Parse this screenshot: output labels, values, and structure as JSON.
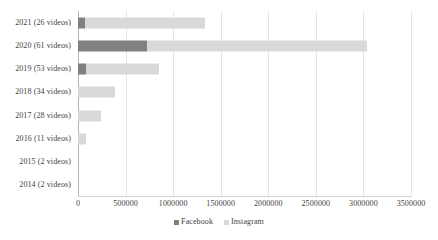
{
  "chart_data": {
    "type": "bar",
    "orientation": "horizontal",
    "stacked": true,
    "title": "",
    "xlabel": "",
    "ylabel": "",
    "grid": true,
    "legend_position": "bottom",
    "xlim": [
      0,
      3500000
    ],
    "xticks": [
      0,
      500000,
      1000000,
      1500000,
      2000000,
      2500000,
      3000000,
      3500000
    ],
    "xtick_labels": [
      "0",
      "500000",
      "1000000",
      "1500000",
      "2000000",
      "2500000",
      "3000000",
      "3500000"
    ],
    "categories": [
      "2021 (26 videos)",
      "2020 (61 videos)",
      "2019 (53 videos)",
      "2018 (34 videos)",
      "2017 (28 videos)",
      "2016 (11 videos)",
      "2015 (2 videos)",
      "2014 (2 videos)"
    ],
    "series": [
      {
        "name": "Facebook",
        "color": "#808080",
        "values": [
          75000,
          725000,
          85000,
          0,
          0,
          0,
          0,
          0
        ]
      },
      {
        "name": "Instagram",
        "color": "#d9d9d9",
        "values": [
          1260000,
          2315000,
          765000,
          390000,
          240000,
          85000,
          0,
          0
        ]
      }
    ]
  },
  "legend": {
    "items": [
      {
        "label": "Facebook",
        "swatch": "facebook-swatch"
      },
      {
        "label": "Instagram",
        "swatch": "instagram-swatch"
      }
    ]
  }
}
